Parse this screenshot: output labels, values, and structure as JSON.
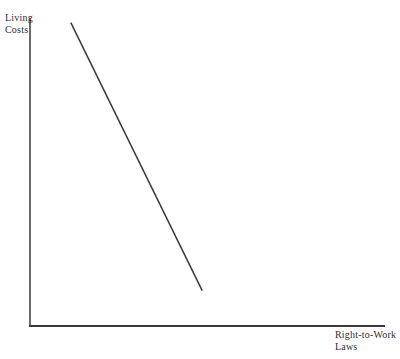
{
  "figure": {
    "background": "#ffffff",
    "ink_color": "#3a3a3a",
    "y_axis_label": "Living\nCosts",
    "x_axis_label": "Right-to-Work\nLaws"
  },
  "chart_data": {
    "type": "line",
    "title": "",
    "xlabel": "Right-to-Work Laws",
    "ylabel": "Living Costs",
    "axis_ticks": [],
    "tick_labels": [],
    "grid": false,
    "legend": false,
    "x_range": [
      0,
      1
    ],
    "y_range": [
      0,
      1
    ],
    "series": [
      {
        "name": "living-costs-vs-right-to-work-laws",
        "trend": "decreasing",
        "points": [
          {
            "x": 0.115,
            "y": 0.985
          },
          {
            "x": 0.485,
            "y": 0.115
          }
        ]
      }
    ]
  }
}
